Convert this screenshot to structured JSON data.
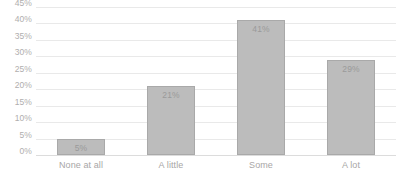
{
  "chart_data": {
    "type": "bar",
    "title": "",
    "subtitle": "",
    "xlabel": "",
    "ylabel": "",
    "categories": [
      "None at all",
      "A little",
      "Some",
      "A lot"
    ],
    "values": [
      5,
      21,
      41,
      29
    ],
    "data_labels": [
      "5%",
      "21%",
      "41%",
      "29%"
    ],
    "ylim": [
      0,
      45
    ],
    "ytick_step": 5,
    "ytick_labels": [
      "45%",
      "40%",
      "35%",
      "30%",
      "25%",
      "20%",
      "15%",
      "10%",
      "5%",
      "0%"
    ],
    "ytick_values": [
      45,
      40,
      35,
      30,
      25,
      20,
      15,
      10,
      5,
      0
    ],
    "grid": true,
    "grid_axis": "y",
    "legend": false,
    "legend_position": "none",
    "series": [
      {
        "name": "",
        "values": [
          5,
          21,
          41,
          29
        ]
      }
    ]
  },
  "style": {
    "bar_fill": "#bcbcbc",
    "bar_border": "#a9a9a9",
    "gridline_color": "#e9e9e9",
    "baseline_color": "#dcdcdc",
    "axis_text_color": "#b0aeae",
    "data_label_color": "#9a9a9a",
    "background": "#ffffff"
  }
}
